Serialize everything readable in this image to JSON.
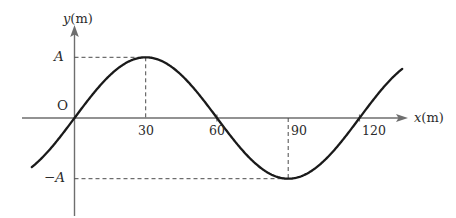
{
  "figure": {
    "title": "",
    "background_color": "#ffffff",
    "curve_color": "#1a1a1a",
    "axis_color": "#6e6e6e",
    "dash_color": "#4a4a4a",
    "text_color": "#2b2b2b"
  },
  "axes": {
    "x_axis_label": {
      "variable": "x",
      "unit": "(m)",
      "full": "x (m)"
    },
    "y_axis_label": {
      "variable": "y",
      "unit": "(m)",
      "full": "y (m)"
    },
    "origin_label": "O",
    "x_ticks": [
      {
        "value": 30,
        "label": "30"
      },
      {
        "value": 60,
        "label": "60"
      },
      {
        "value": 90,
        "label": "90"
      },
      {
        "value": 120,
        "label": "120"
      }
    ],
    "y_ticks": [
      {
        "value": 1,
        "label": "A"
      },
      {
        "value": -1,
        "label": "−A"
      }
    ],
    "xlim": [
      -18,
      138
    ],
    "ylim": [
      -1.42,
      1.52
    ]
  },
  "guides": {
    "dashed_lines": [
      {
        "name": "peak-horizontal",
        "orientation": "horizontal",
        "y_value": 1,
        "from_x": 0,
        "to_x": 30
      },
      {
        "name": "peak-vertical",
        "orientation": "vertical",
        "x_value": 30,
        "from_y": 0,
        "to_y": 1
      },
      {
        "name": "trough-horizontal",
        "orientation": "horizontal",
        "y_value": -1,
        "from_x": 0,
        "to_x": 90
      },
      {
        "name": "trough-vertical",
        "orientation": "vertical",
        "x_value": 90,
        "from_y": 0,
        "to_y": -1
      }
    ]
  },
  "chart_data": {
    "type": "line",
    "title": "",
    "xlabel": "x (m)",
    "ylabel": "y (m)",
    "xlim": [
      -18,
      138
    ],
    "ylim": [
      -1.42,
      1.52
    ],
    "grid": false,
    "legend": null,
    "equation": "y = A sin(2πx / 120)",
    "amplitude_label": "A",
    "wavelength": 120,
    "x_tick_labels": [
      "30",
      "60",
      "90",
      "120"
    ],
    "x_tick_values": [
      30,
      60,
      90,
      120
    ],
    "y_tick_labels": [
      "A",
      "−A"
    ],
    "y_tick_values": [
      1,
      -1
    ],
    "annotations": [
      {
        "text": "A",
        "x": 0,
        "y": 1,
        "position": "left-of-y-axis"
      },
      {
        "text": "−A",
        "x": 0,
        "y": -1,
        "position": "left-of-y-axis"
      },
      {
        "text": "O",
        "x": 0,
        "y": 0,
        "position": "upper-left-of-origin"
      }
    ],
    "series": [
      {
        "name": "wave",
        "x": [
          -18,
          -15,
          -12,
          -9,
          -6,
          -3,
          0,
          3,
          6,
          9,
          12,
          15,
          18,
          21,
          24,
          27,
          30,
          33,
          36,
          39,
          42,
          45,
          48,
          51,
          54,
          57,
          60,
          63,
          66,
          69,
          72,
          75,
          78,
          81,
          84,
          87,
          90,
          93,
          96,
          99,
          102,
          105,
          108,
          111,
          114,
          117,
          120,
          123,
          126,
          129,
          132,
          135,
          138
        ],
        "y": [
          -0.809,
          -0.707,
          -0.588,
          -0.454,
          -0.309,
          -0.156,
          0.0,
          0.156,
          0.309,
          0.454,
          0.588,
          0.707,
          0.809,
          0.891,
          0.951,
          0.988,
          1.0,
          0.988,
          0.951,
          0.891,
          0.809,
          0.707,
          0.588,
          0.454,
          0.309,
          0.156,
          0.0,
          -0.156,
          -0.309,
          -0.454,
          -0.588,
          -0.707,
          -0.809,
          -0.891,
          -0.951,
          -0.988,
          -1.0,
          -0.988,
          -0.951,
          -0.891,
          -0.809,
          -0.707,
          -0.588,
          -0.454,
          -0.309,
          -0.156,
          0.0,
          0.156,
          0.309,
          0.454,
          0.588,
          0.707,
          0.809
        ]
      }
    ],
    "key_points": [
      {
        "label": "zero-crossing-rising",
        "x": 0,
        "y": 0
      },
      {
        "label": "crest",
        "x": 30,
        "y": 1
      },
      {
        "label": "zero-crossing-falling",
        "x": 60,
        "y": 0
      },
      {
        "label": "trough",
        "x": 90,
        "y": -1
      },
      {
        "label": "zero-crossing-rising",
        "x": 120,
        "y": 0
      }
    ]
  }
}
